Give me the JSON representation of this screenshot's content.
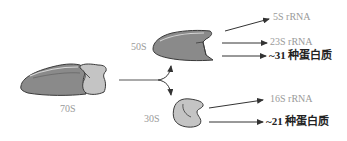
{
  "diagram": {
    "type": "ribosome-dissociation",
    "colors": {
      "large_subunit": "#8a8a8a",
      "small_subunit": "#c4c4c4",
      "outline": "#3a3a3a",
      "arrow": "#333333",
      "gray_text": "#9a9a9a",
      "dark_text": "#222222"
    },
    "ribosome": {
      "label": "70S"
    },
    "large_subunit": {
      "label": "50S",
      "components": [
        {
          "label": "5S rRNA",
          "style": "gray"
        },
        {
          "label": "23S rRNA",
          "style": "gray"
        },
        {
          "label": "~31 种蛋白质",
          "style": "dark"
        }
      ]
    },
    "small_subunit": {
      "label": "30S",
      "components": [
        {
          "label": "16S rRNA",
          "style": "gray"
        },
        {
          "label": "~21 种蛋白质",
          "style": "dark"
        }
      ]
    }
  }
}
